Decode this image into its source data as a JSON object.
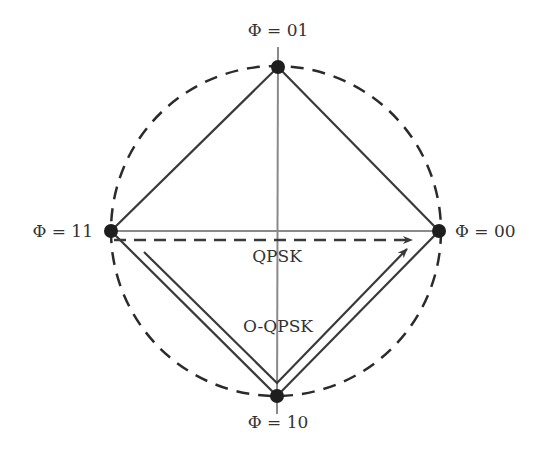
{
  "diagram": {
    "colors": {
      "circle": "#2b2b2b",
      "diamond": "#3a3a3a",
      "axis": "#8a8a8a",
      "points": "#1e1e1e",
      "text": "#333333"
    },
    "points": [
      {
        "id": "top",
        "label": "Φ = 01"
      },
      {
        "id": "right",
        "label": "Φ = 00"
      },
      {
        "id": "bottom",
        "label": "Φ = 10"
      },
      {
        "id": "left",
        "label": "Φ = 11"
      }
    ],
    "transitions": [
      {
        "name": "QPSK",
        "label": "QPSK",
        "style": "dashed",
        "from": "Φ = 11",
        "to": "Φ = 00"
      },
      {
        "name": "O-QPSK",
        "label": "O-QPSK",
        "style": "solid",
        "from": "Φ = 11",
        "via": "Φ = 10",
        "to": "Φ = 00"
      }
    ]
  }
}
